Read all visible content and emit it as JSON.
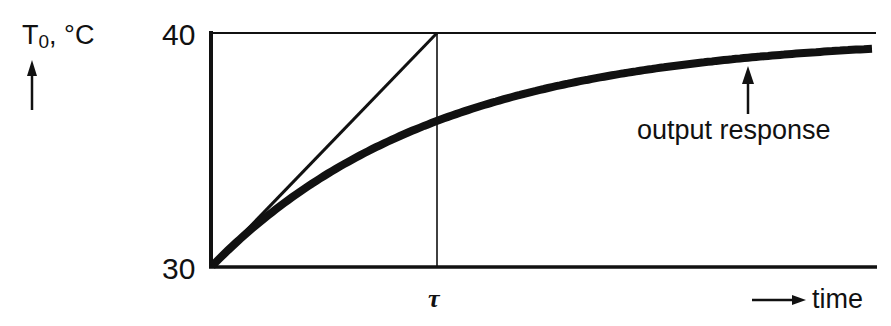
{
  "chart_data": {
    "type": "line",
    "title": "",
    "ylabel": "T0, °C",
    "ylabel_main": "T",
    "ylabel_sub": "0",
    "ylabel_unit": ", °C",
    "xlabel": "time",
    "yticks": [
      "30",
      "40"
    ],
    "xticks": [
      "τ"
    ],
    "ylim": [
      30,
      40
    ],
    "annotation": "output response",
    "series": [
      {
        "name": "output response",
        "description": "first-order exponential rise from 30 toward 40",
        "x_over_tau": [
          0,
          0.5,
          1,
          1.5,
          2,
          2.5,
          2.95
        ],
        "values": [
          30,
          33.9,
          36.3,
          37.8,
          38.6,
          39.1,
          39.3
        ]
      },
      {
        "name": "initial tangent",
        "x_over_tau": [
          0,
          1
        ],
        "values": [
          30,
          40
        ]
      }
    ],
    "grid": false,
    "legend": "none"
  }
}
